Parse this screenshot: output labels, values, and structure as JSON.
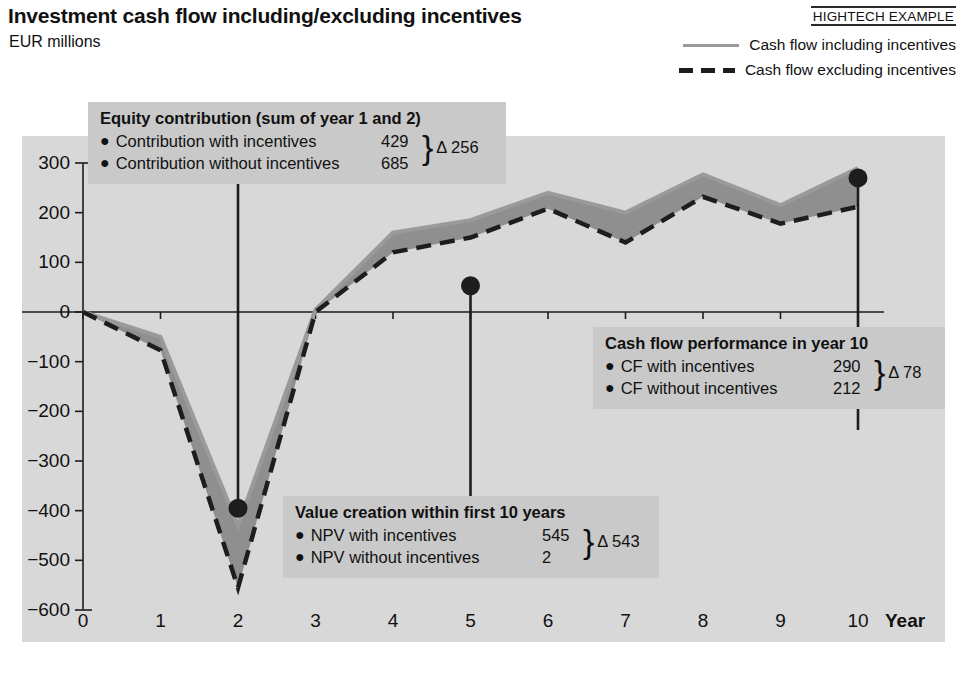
{
  "header": {
    "title": "Investment cash flow including/excluding incentives",
    "subtitle": "EUR millions",
    "source_tag": "HIGHTECH EXAMPLE"
  },
  "legend": {
    "items": [
      {
        "label": "Cash flow including incentives",
        "style": "solid",
        "color": "#9a9a9a"
      },
      {
        "label": "Cash flow excluding incentives",
        "style": "dashed",
        "color": "#1d1d1d"
      }
    ]
  },
  "callouts": [
    {
      "id": "equity-contribution",
      "title": "Equity contribution (sum of year 1 and 2)",
      "rows": [
        {
          "label": "Contribution with incentives",
          "value": "429"
        },
        {
          "label": "Contribution without incentives",
          "value": "685"
        }
      ],
      "delta": "Δ 256",
      "anchor_year": 2,
      "anchor_value": -395
    },
    {
      "id": "value-creation",
      "title": "Value creation within first 10 years",
      "rows": [
        {
          "label": "NPV with incentives",
          "value": "545"
        },
        {
          "label": "NPV without incentives",
          "value": "2"
        }
      ],
      "delta": "Δ 543",
      "anchor_year": 5,
      "anchor_value": 53
    },
    {
      "id": "cash-flow-year-10",
      "title": "Cash flow performance in year 10",
      "rows": [
        {
          "label": "CF with incentives",
          "value": "290"
        },
        {
          "label": "CF without incentives",
          "value": "212"
        }
      ],
      "delta": "Δ 78",
      "anchor_year": 10,
      "anchor_value": 270
    }
  ],
  "chart_data": {
    "type": "area",
    "title": "Investment cash flow including/excluding incentives",
    "subtitle": "EUR millions",
    "xlabel": "Year",
    "ylabel": "EUR millions",
    "x": [
      0,
      1,
      2,
      3,
      4,
      5,
      6,
      7,
      8,
      9,
      10
    ],
    "xtick_labels": [
      "0",
      "1",
      "2",
      "3",
      "4",
      "5",
      "6",
      "7",
      "8",
      "9",
      "10"
    ],
    "ytick_labels": [
      "300",
      "200",
      "100",
      "0",
      "−100",
      "−200",
      "−300",
      "−400",
      "−500",
      "−600"
    ],
    "yticks": [
      300,
      200,
      100,
      0,
      -100,
      -200,
      -300,
      -400,
      -500,
      -600
    ],
    "ylim": [
      -600,
      300
    ],
    "xlim": [
      0,
      10
    ],
    "grid": false,
    "series": [
      {
        "name": "Cash flow including incentives",
        "style": "solid",
        "color": "#9a9a9a",
        "values": [
          0,
          -50,
          -430,
          5,
          160,
          185,
          240,
          200,
          277,
          215,
          290
        ]
      },
      {
        "name": "Cash flow excluding incentives",
        "style": "dashed",
        "color": "#1d1d1d",
        "values": [
          0,
          -77,
          -555,
          0,
          120,
          150,
          208,
          140,
          232,
          178,
          212
        ]
      }
    ],
    "markers": [
      {
        "year": 2,
        "value": -395
      },
      {
        "year": 5,
        "value": 53
      },
      {
        "year": 10,
        "value": 270
      }
    ],
    "colors": {
      "panel_background": "#d8d8d8",
      "band_fill": "#8f8f8f",
      "callout_background": "#c9c9c9",
      "axis": "#1d1d1d"
    }
  }
}
